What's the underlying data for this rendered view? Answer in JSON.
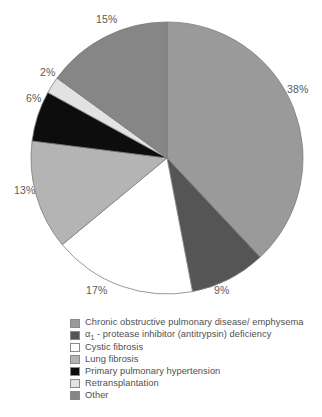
{
  "chart_data": {
    "type": "pie",
    "title": "",
    "categories": [
      "Chronic obstructive pulmonary disease/ emphysema",
      "α₁ - protease inhibitor (antitrypsin) deficiency",
      "Cystic fibrosis",
      "Lung fibrosis",
      "Primary pulmonary hypertension",
      "Retransplantation",
      "Other"
    ],
    "values": [
      38,
      9,
      17,
      13,
      6,
      2,
      15
    ],
    "value_labels": [
      "38%",
      "9%",
      "17%",
      "13%",
      "6%",
      "2%",
      "15%"
    ],
    "colors": [
      "#9a9a9a",
      "#555555",
      "#ffffff",
      "#b4b4b4",
      "#0d0d0d",
      "#e2e2e2",
      "#868686"
    ],
    "unit": "%",
    "start_angle_deg": 0,
    "direction": "clockwise",
    "legend_position": "bottom",
    "grid": false
  },
  "pie": {
    "slices": [
      {
        "label": "38%",
        "value": 38,
        "color": "#9a9a9a",
        "label_x": 287,
        "label_y": 84
      },
      {
        "label": "9%",
        "value": 9,
        "color": "#555555",
        "label_x": 214,
        "label_y": 285
      },
      {
        "label": "17%",
        "value": 17,
        "color": "#ffffff",
        "label_x": 86,
        "label_y": 285
      },
      {
        "label": "13%",
        "value": 13,
        "color": "#b4b4b4",
        "label_x": 14,
        "label_y": 185
      },
      {
        "label": "6%",
        "value": 6,
        "color": "#0d0d0d",
        "label_x": 26,
        "label_y": 93
      },
      {
        "label": "2%",
        "value": 2,
        "color": "#e2e2e2",
        "label_x": 40,
        "label_y": 67
      },
      {
        "label": "15%",
        "value": 15,
        "color": "#868686",
        "label_x": 96,
        "label_y": 14
      }
    ],
    "center_x": 167,
    "center_y": 158,
    "radius": 136,
    "outline_color": "#7c7c7c"
  },
  "legend": {
    "items": [
      {
        "label": "Chronic obstructive pulmonary disease/ emphysema",
        "color": "#9a9a9a"
      },
      {
        "label": "- protease inhibitor (antitrypsin) deficiency",
        "color": "#555555",
        "prefix_alpha": true
      },
      {
        "label": "Cystic fibrosis",
        "color": "#ffffff"
      },
      {
        "label": "Lung fibrosis",
        "color": "#b4b4b4"
      },
      {
        "label": "Primary pulmonary hypertension",
        "color": "#0d0d0d"
      },
      {
        "label": "Retransplantation",
        "color": "#e2e2e2"
      },
      {
        "label": "Other",
        "color": "#868686"
      }
    ]
  }
}
